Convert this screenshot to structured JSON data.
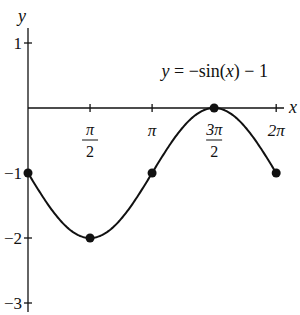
{
  "chart_data": {
    "type": "line",
    "title": "y = −sin(x) − 1",
    "equation_label": "y = −sin(x) − 1",
    "xlabel": "x",
    "ylabel": "y",
    "xlim": [
      0,
      6.2832
    ],
    "ylim": [
      -3,
      1
    ],
    "grid": false,
    "legend": "none",
    "x_ticks": [
      {
        "value": 1.5708,
        "label_num": "π",
        "label_den": "2"
      },
      {
        "value": 3.1416,
        "label_num": "π",
        "label_den": ""
      },
      {
        "value": 4.7124,
        "label_num": "3π",
        "label_den": "2"
      },
      {
        "value": 6.2832,
        "label_num": "2π",
        "label_den": ""
      }
    ],
    "y_ticks": [
      {
        "value": 1,
        "label": "1"
      },
      {
        "value": -1,
        "label": "−1"
      },
      {
        "value": -2,
        "label": "−2"
      },
      {
        "value": -3,
        "label": "−3"
      }
    ],
    "series": [
      {
        "name": "y = −sin(x) − 1",
        "function": "-sin(x) - 1",
        "x_range": [
          0,
          6.2832
        ],
        "key_points": [
          {
            "x": 0,
            "x_label": "0",
            "y": -1
          },
          {
            "x": 1.5708,
            "x_label": "π/2",
            "y": -2
          },
          {
            "x": 3.1416,
            "x_label": "π",
            "y": -1
          },
          {
            "x": 4.7124,
            "x_label": "3π/2",
            "y": 0
          },
          {
            "x": 6.2832,
            "x_label": "2π",
            "y": -1
          }
        ]
      }
    ]
  },
  "layout": {
    "origin_px": [
      28,
      108
    ],
    "x_unit_px": 39.5,
    "y_unit_px": 65,
    "line_color": "#111111"
  }
}
